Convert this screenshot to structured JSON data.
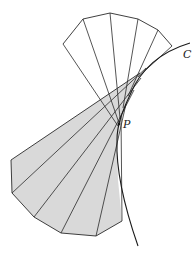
{
  "diagram": {
    "labels": {
      "curve": "C",
      "point": "P"
    },
    "colors": {
      "stroke": "#2a2a2a",
      "shade": "#d9d9d9",
      "background": "#ffffff"
    },
    "upper_fan": {
      "fill": "none",
      "outer_vertices": [
        [
          63,
          44
        ],
        [
          83,
          19
        ],
        [
          110,
          13
        ],
        [
          138,
          19
        ],
        [
          158,
          30
        ],
        [
          172,
          46
        ]
      ]
    },
    "lower_fan": {
      "fill": "shaded",
      "outer_vertices": [
        [
          11,
          160
        ],
        [
          12,
          193
        ],
        [
          34,
          217
        ],
        [
          61,
          233
        ],
        [
          96,
          236
        ],
        [
          122,
          221
        ]
      ]
    }
  }
}
